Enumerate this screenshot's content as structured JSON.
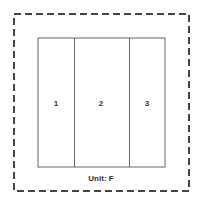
{
  "diagram": {
    "title": "",
    "boundary": {
      "style": "dashed",
      "color": "#444444"
    },
    "unit": {
      "label": "Unit: F"
    },
    "panels": [
      {
        "label": "1"
      },
      {
        "label": "2"
      },
      {
        "label": "3"
      }
    ],
    "colors": {
      "panel_stroke": "#666666",
      "text": "#333333",
      "background": "#ffffff"
    }
  }
}
